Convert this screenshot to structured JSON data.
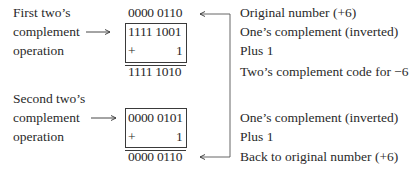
{
  "first_op": {
    "label_lines": [
      "First two’s",
      "complement",
      "operation"
    ],
    "original": "0000 0110",
    "inverted": "1111 1001",
    "plus_sign": "+",
    "plus_value": "1",
    "result": "1111 1010"
  },
  "second_op": {
    "label_lines": [
      "Second two’s",
      "complement",
      "operation"
    ],
    "inverted": "0000 0101",
    "plus_sign": "+",
    "plus_value": "1",
    "result": "0000 0110"
  },
  "annotations": {
    "first": [
      "Original number (+6)",
      "One’s complement (inverted)",
      "Plus 1",
      "Two’s complement code for −6"
    ],
    "second": [
      "One’s complement (inverted)",
      "Plus 1",
      "Back to original number (+6)"
    ]
  },
  "colors": {
    "ink": "#2a2a2a",
    "background": "#ffffff"
  }
}
